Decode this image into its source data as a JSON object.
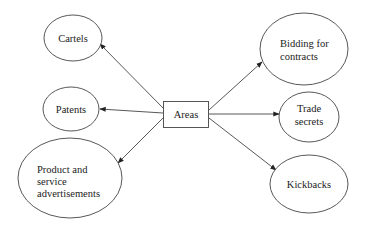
{
  "diagram": {
    "center": {
      "label": "Areas"
    },
    "nodes": [
      {
        "id": "cartels",
        "lines": [
          "Cartels"
        ]
      },
      {
        "id": "patents",
        "lines": [
          "Patents"
        ]
      },
      {
        "id": "product",
        "lines": [
          "Product and",
          "service",
          "advertisements"
        ]
      },
      {
        "id": "bidding",
        "lines": [
          "Bidding for",
          "contracts"
        ]
      },
      {
        "id": "trade",
        "lines": [
          "Trade",
          "secrets"
        ]
      },
      {
        "id": "kickbacks",
        "lines": [
          "Kickbacks"
        ]
      }
    ],
    "edges": [
      {
        "from": "Areas",
        "to": "Cartels"
      },
      {
        "from": "Areas",
        "to": "Patents"
      },
      {
        "from": "Areas",
        "to": "Product and service advertisements"
      },
      {
        "from": "Areas",
        "to": "Bidding for contracts"
      },
      {
        "from": "Areas",
        "to": "Trade secrets"
      },
      {
        "from": "Areas",
        "to": "Kickbacks"
      }
    ],
    "colors": {
      "stroke": "#444444",
      "text": "#222222",
      "background": "#ffffff"
    }
  }
}
